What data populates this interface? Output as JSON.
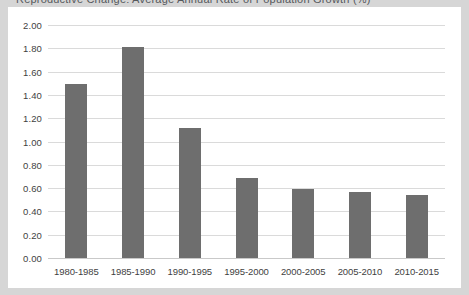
{
  "title_sliver": "Reproductive Change: Average Annual Rate of Population Growth (%)",
  "colors": {
    "bar": "#6e6e6e",
    "gridline": "#dadada",
    "axis": "#c9c9c9",
    "text": "#3f3f3f",
    "plot_background": "#ffffff",
    "figure_background": "#d6d6d6"
  },
  "chart_data": {
    "type": "bar",
    "title": "",
    "xlabel": "",
    "ylabel": "",
    "categories": [
      "1980-1985",
      "1985-1990",
      "1990-1995",
      "1995-2000",
      "2000-2005",
      "2005-2010",
      "2010-2015"
    ],
    "values": [
      1.49,
      1.81,
      1.12,
      0.69,
      0.59,
      0.57,
      0.54
    ],
    "ylim": [
      0.0,
      2.0
    ],
    "ytick_values": [
      0.0,
      0.2,
      0.4,
      0.6,
      0.8,
      1.0,
      1.2,
      1.4,
      1.6,
      1.8,
      2.0
    ],
    "ytick_labels": [
      "0.00",
      "0.20",
      "0.40",
      "0.60",
      "0.80",
      "1.00",
      "1.20",
      "1.40",
      "1.60",
      "1.80",
      "2.00"
    ],
    "grid": true,
    "grid_axis": "y",
    "legend": false,
    "legend_position": "none",
    "series": [
      {
        "name": "",
        "values": [
          1.49,
          1.81,
          1.12,
          0.69,
          0.59,
          0.57,
          0.54
        ]
      }
    ]
  }
}
